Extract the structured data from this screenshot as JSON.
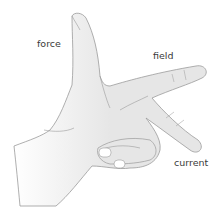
{
  "diagram": {
    "labels": {
      "force": "force",
      "field": "field",
      "current": "current"
    },
    "colors": {
      "hand_fill": "#e6e6e6",
      "outline": "#9a9a9a",
      "text": "#3a3a3a",
      "background": "#ffffff"
    }
  }
}
